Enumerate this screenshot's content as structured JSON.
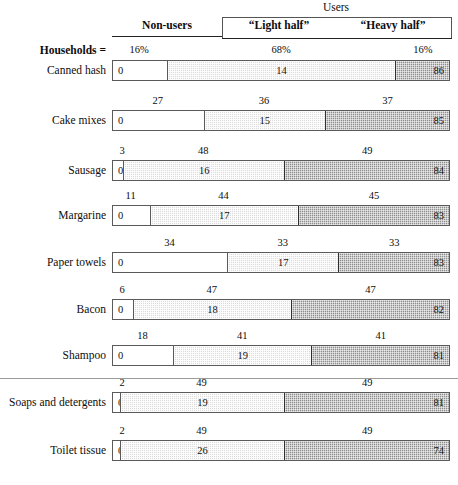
{
  "header": {
    "users_group": "Users",
    "non_users": "Non-users",
    "light_half": "“Light half”",
    "heavy_half": "“Heavy half”"
  },
  "households_row": {
    "label": "Households =",
    "values": [
      "16%",
      "68%",
      "16%"
    ]
  },
  "chart_data": {
    "type": "bar",
    "title": "",
    "subtitle": "",
    "xlabel": "",
    "ylabel": "",
    "xlim": [
      0,
      100
    ],
    "grid": false,
    "legend_position": "top",
    "orientation": "horizontal-stacked",
    "categories": [
      "Canned hash",
      "Cake mixes",
      "Sausage",
      "Margarine",
      "Paper towels",
      "Bacon",
      "Shampoo",
      "Soaps and detergents",
      "Toilet tissue"
    ],
    "segment_names": [
      "Non-users",
      "“Light half”",
      "“Heavy half”"
    ],
    "households_percent": {
      "Households =": [
        16,
        68,
        16
      ],
      "Canned hash": [
        16,
        68,
        16
      ],
      "Cake mixes": [
        27,
        36,
        37
      ],
      "Sausage": [
        3,
        48,
        49
      ],
      "Margarine": [
        11,
        44,
        45
      ],
      "Paper towels": [
        34,
        33,
        33
      ],
      "Bacon": [
        6,
        47,
        47
      ],
      "Shampoo": [
        18,
        41,
        41
      ],
      "Soaps and detergents": [
        2,
        49,
        49
      ],
      "Toilet tissue": [
        2,
        49,
        49
      ]
    },
    "volume_percent": {
      "Canned hash": [
        0,
        14,
        86
      ],
      "Cake mixes": [
        0,
        15,
        85
      ],
      "Sausage": [
        0,
        16,
        84
      ],
      "Margarine": [
        0,
        17,
        83
      ],
      "Paper towels": [
        0,
        17,
        83
      ],
      "Bacon": [
        0,
        18,
        82
      ],
      "Shampoo": [
        0,
        19,
        81
      ],
      "Soaps and detergents": [
        0,
        19,
        81
      ],
      "Toilet tissue": [
        0,
        26,
        74
      ]
    }
  },
  "rows": [
    {
      "label": "Canned hash",
      "top_labels": [
        "16%",
        "68%",
        "16%"
      ],
      "widths": [
        16,
        68,
        16
      ],
      "segments": [
        "0",
        "14",
        "86"
      ],
      "is_header_row": true
    },
    {
      "label": "Cake mixes",
      "top_labels": [
        "27",
        "36",
        "37"
      ],
      "widths": [
        27,
        36,
        37
      ],
      "segments": [
        "0",
        "15",
        "85"
      ]
    },
    {
      "label": "Sausage",
      "top_labels": [
        "3",
        "48",
        "49"
      ],
      "widths": [
        3,
        48,
        49
      ],
      "segments": [
        "0",
        "16",
        "84"
      ]
    },
    {
      "label": "Margarine",
      "top_labels": [
        "11",
        "44",
        "45"
      ],
      "widths": [
        11,
        44,
        45
      ],
      "segments": [
        "0",
        "17",
        "83"
      ]
    },
    {
      "label": "Paper towels",
      "top_labels": [
        "34",
        "33",
        "33"
      ],
      "widths": [
        34,
        33,
        33
      ],
      "segments": [
        "0",
        "17",
        "83"
      ]
    },
    {
      "label": "Bacon",
      "top_labels": [
        "6",
        "47",
        "47"
      ],
      "widths": [
        6,
        47,
        47
      ],
      "segments": [
        "0",
        "18",
        "82"
      ]
    },
    {
      "label": "Shampoo",
      "top_labels": [
        "18",
        "41",
        "41"
      ],
      "widths": [
        18,
        41,
        41
      ],
      "segments": [
        "0",
        "19",
        "81"
      ]
    },
    {
      "label": "Soaps and detergents",
      "top_labels": [
        "2",
        "49",
        "49"
      ],
      "widths": [
        2,
        49,
        49
      ],
      "segments": [
        "0",
        "19",
        "81"
      ]
    },
    {
      "label": "Toilet tissue",
      "top_labels": [
        "2",
        "49",
        "49"
      ],
      "widths": [
        2,
        49,
        49
      ],
      "segments": [
        "0",
        "26",
        "74"
      ]
    }
  ],
  "colors": {
    "non_users": "#ffffff",
    "light_half": "#dcdcdc",
    "heavy_half": "#8e8e8e",
    "outline": "#5a5a5a",
    "text": "#0d0d0d"
  }
}
